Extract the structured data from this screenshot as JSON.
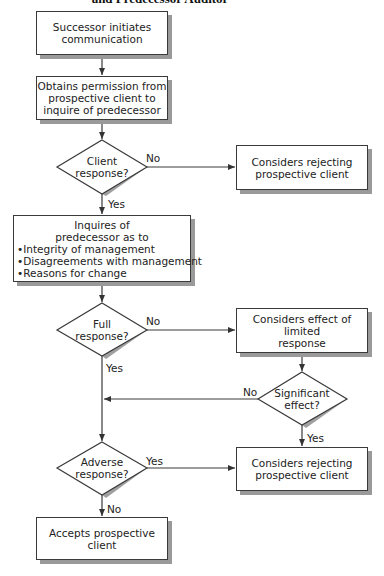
{
  "title": "and Predecessor Auditor",
  "nodes": {
    "start": {
      "lines": [
        "Successor initiates",
        "communication"
      ]
    },
    "permission": {
      "lines": [
        "Obtains permission from",
        "prospective client to",
        "inquire of predecessor"
      ]
    },
    "client_response": {
      "lines": [
        "Client",
        "response?"
      ]
    },
    "reject1": {
      "lines": [
        "Considers rejecting",
        "prospective client"
      ]
    },
    "inquire": {
      "lines": [
        "Inquires of",
        "predecessor as to"
      ],
      "bullets": [
        "•Integrity of management",
        "•Disagreements with management",
        "•Reasons for change"
      ]
    },
    "full_response": {
      "lines": [
        "Full",
        "response?"
      ]
    },
    "limited": {
      "lines": [
        "Considers effect of",
        "limited",
        "response"
      ]
    },
    "significant": {
      "lines": [
        "Significant",
        "effect?"
      ]
    },
    "adverse": {
      "lines": [
        "Adverse",
        "response?"
      ]
    },
    "reject2": {
      "lines": [
        "Considers rejecting",
        "prospective client"
      ]
    },
    "accept": {
      "lines": [
        "Accepts prospective",
        "client"
      ]
    }
  },
  "edge_labels": {
    "client_no": "No",
    "client_yes": "Yes",
    "full_no": "No",
    "full_yes": "Yes",
    "significant_no": "No",
    "significant_yes": "Yes",
    "adverse_yes": "Yes",
    "adverse_no": "No"
  }
}
